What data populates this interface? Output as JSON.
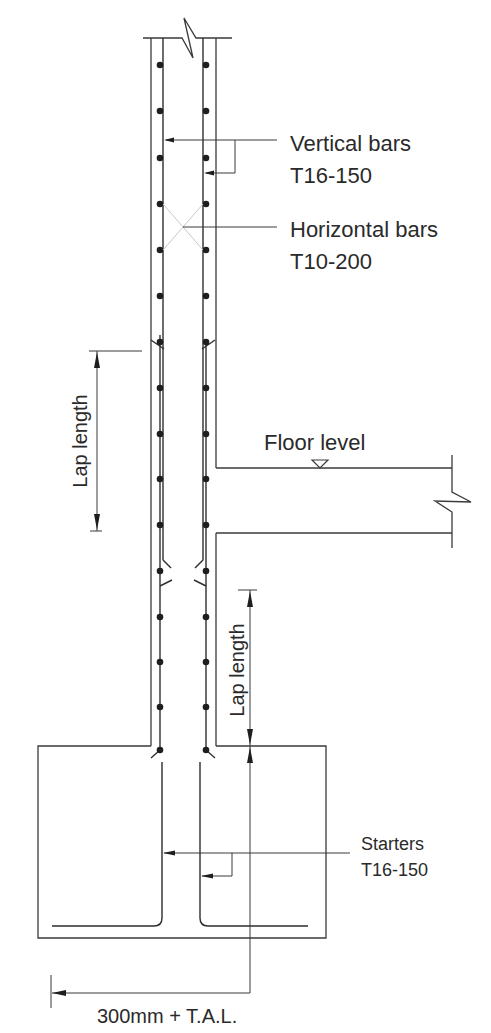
{
  "diagram": {
    "type": "reinforced concrete wall section with footing",
    "labels": {
      "vertical_bars": {
        "line1": "Vertical bars",
        "line2": "T16-150"
      },
      "horizontal_bars": {
        "line1": "Horizontal bars",
        "line2": "T10-200"
      },
      "lap_length_upper": "Lap length",
      "floor_level": "Floor level",
      "lap_length_lower": "Lap length",
      "starters": {
        "line1": "Starters",
        "line2": "T16-150"
      },
      "anchorage": "300mm + T.A.L."
    },
    "symbols": {
      "floor_level_marker": "triangle-down",
      "break_lines": [
        "wall-top-break",
        "slab-right-break"
      ]
    }
  }
}
